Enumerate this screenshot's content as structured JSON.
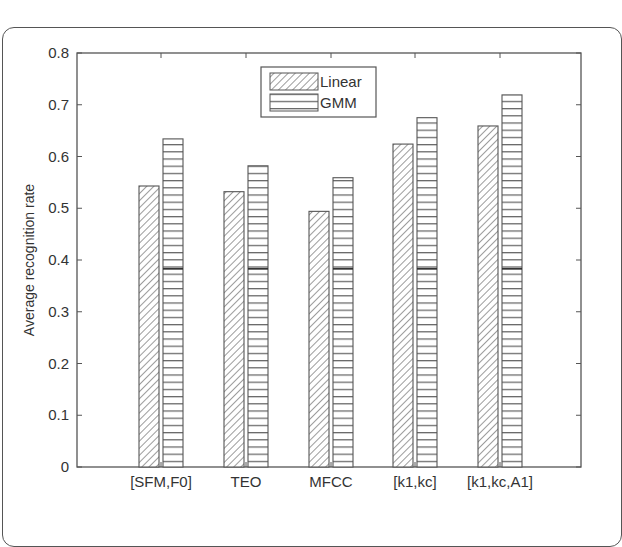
{
  "chart_data": {
    "type": "bar",
    "title": "",
    "xlabel": "",
    "ylabel": "Average recognition rate",
    "ylim": [
      0,
      0.8
    ],
    "yticks": [
      "0",
      "0.1",
      "0.2",
      "0.3",
      "0.4",
      "0.5",
      "0.6",
      "0.7",
      "0.8"
    ],
    "grid": false,
    "legend_position": "top-center (inside plot)",
    "categories": [
      "[SFM,F0]",
      "TEO",
      "MFCC",
      "[k1,kc]",
      "[k1,kc,A1]"
    ],
    "series": [
      {
        "name": "Linear",
        "pattern": "diagonal-hatch",
        "values": [
          0.543,
          0.532,
          0.494,
          0.624,
          0.659
        ]
      },
      {
        "name": "GMM",
        "pattern": "horizontal-hatch",
        "values": [
          0.634,
          0.582,
          0.559,
          0.675,
          0.719
        ]
      }
    ]
  },
  "legend": {
    "items": [
      {
        "label": "Linear"
      },
      {
        "label": "GMM"
      }
    ]
  },
  "colors": {
    "axis": "#555555",
    "bar_stroke": "#555555",
    "hatch": "#666666",
    "background": "#ffffff"
  }
}
